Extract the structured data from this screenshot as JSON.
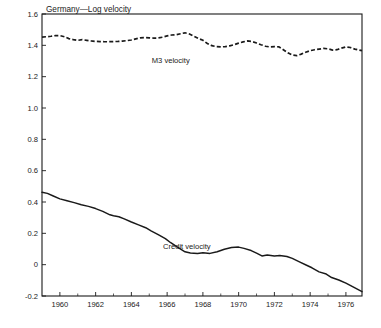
{
  "chart_data": {
    "type": "line",
    "title": "Germany—Log velocity",
    "xlabel": "",
    "ylabel": "",
    "xlim": [
      1959.0,
      1976.9
    ],
    "ylim": [
      -0.2,
      1.6
    ],
    "grid": false,
    "legend_position": "inline-annotations",
    "yticks": [
      "1.6",
      "1.4",
      "1.2",
      "1.0",
      "0.8",
      "0.6",
      "0.4",
      "0.2",
      "0",
      "-0.2"
    ],
    "ytick_values": [
      1.6,
      1.4,
      1.2,
      1.0,
      0.8,
      0.6,
      0.4,
      0.2,
      0.0,
      -0.2
    ],
    "xticks": [
      "1960",
      "1962",
      "1964",
      "1966",
      "1968",
      "1970",
      "1972",
      "1974",
      "1976"
    ],
    "xtick_values": [
      1960,
      1962,
      1964,
      1966,
      1968,
      1970,
      1972,
      1974,
      1976
    ],
    "xminor_values": [
      1961,
      1963,
      1965,
      1967,
      1969,
      1971,
      1973,
      1975
    ],
    "annotations": [
      {
        "text": "M3 velocity",
        "x": 1966.2,
        "y": 1.285,
        "name": "m3-velocity-annotation"
      },
      {
        "text": "Credit velocity",
        "x": 1967.1,
        "y": 0.098,
        "name": "credit-velocity-annotation"
      }
    ],
    "series": [
      {
        "name": "M3 velocity",
        "style": "dashed",
        "color": "#1a1a1a",
        "x": [
          1959.0,
          1959.25,
          1959.5,
          1959.75,
          1960.0,
          1960.25,
          1960.5,
          1960.75,
          1961.0,
          1961.25,
          1961.5,
          1961.75,
          1962.0,
          1962.25,
          1962.5,
          1962.75,
          1963.0,
          1963.25,
          1963.5,
          1963.75,
          1964.0,
          1964.25,
          1964.5,
          1964.75,
          1965.0,
          1965.25,
          1965.5,
          1965.75,
          1966.0,
          1966.25,
          1966.5,
          1966.75,
          1967.0,
          1967.25,
          1967.5,
          1967.75,
          1968.0,
          1968.25,
          1968.5,
          1968.75,
          1969.0,
          1969.25,
          1969.5,
          1969.75,
          1970.0,
          1970.25,
          1970.5,
          1970.75,
          1971.0,
          1971.25,
          1971.5,
          1971.75,
          1972.0,
          1972.25,
          1972.5,
          1972.75,
          1973.0,
          1973.25,
          1973.5,
          1973.75,
          1974.0,
          1974.25,
          1974.5,
          1974.75,
          1975.0,
          1975.25,
          1975.5,
          1975.75,
          1976.0,
          1976.25,
          1976.5,
          1976.9
        ],
        "y": [
          1.452,
          1.455,
          1.458,
          1.462,
          1.462,
          1.455,
          1.443,
          1.436,
          1.432,
          1.436,
          1.432,
          1.428,
          1.425,
          1.424,
          1.423,
          1.423,
          1.424,
          1.425,
          1.427,
          1.43,
          1.434,
          1.441,
          1.448,
          1.45,
          1.448,
          1.446,
          1.447,
          1.452,
          1.46,
          1.466,
          1.468,
          1.474,
          1.48,
          1.472,
          1.458,
          1.444,
          1.432,
          1.412,
          1.398,
          1.392,
          1.39,
          1.392,
          1.397,
          1.404,
          1.414,
          1.422,
          1.428,
          1.424,
          1.415,
          1.404,
          1.394,
          1.39,
          1.392,
          1.39,
          1.372,
          1.352,
          1.338,
          1.334,
          1.344,
          1.356,
          1.366,
          1.372,
          1.376,
          1.38,
          1.378,
          1.37,
          1.372,
          1.382,
          1.39,
          1.386,
          1.376,
          1.366
        ]
      },
      {
        "name": "Credit velocity",
        "style": "solid",
        "color": "#1a1a1a",
        "x": [
          1959.0,
          1959.3,
          1959.6,
          1960.0,
          1960.4,
          1960.8,
          1961.2,
          1961.6,
          1962.0,
          1962.4,
          1962.8,
          1963.0,
          1963.3,
          1963.6,
          1964.0,
          1964.4,
          1964.8,
          1965.1,
          1965.5,
          1965.9,
          1966.2,
          1966.6,
          1967.0,
          1967.3,
          1967.7,
          1968.0,
          1968.4,
          1968.8,
          1969.2,
          1969.6,
          1970.0,
          1970.3,
          1970.7,
          1971.0,
          1971.3,
          1971.6,
          1972.0,
          1972.3,
          1972.7,
          1973.0,
          1973.4,
          1973.8,
          1974.1,
          1974.5,
          1974.9,
          1975.2,
          1975.6,
          1976.0,
          1976.4,
          1976.9
        ],
        "y": [
          0.462,
          0.455,
          0.44,
          0.42,
          0.408,
          0.396,
          0.382,
          0.372,
          0.358,
          0.34,
          0.318,
          0.312,
          0.306,
          0.292,
          0.272,
          0.254,
          0.236,
          0.216,
          0.192,
          0.166,
          0.14,
          0.11,
          0.082,
          0.074,
          0.072,
          0.076,
          0.072,
          0.082,
          0.098,
          0.11,
          0.112,
          0.104,
          0.09,
          0.074,
          0.056,
          0.062,
          0.056,
          0.058,
          0.052,
          0.04,
          0.018,
          -0.004,
          -0.02,
          -0.046,
          -0.06,
          -0.082,
          -0.098,
          -0.118,
          -0.142,
          -0.172
        ]
      }
    ]
  },
  "plot_geometry": {
    "left_px": 42,
    "right_px": 362,
    "top_px": 14,
    "bottom_px": 296
  }
}
